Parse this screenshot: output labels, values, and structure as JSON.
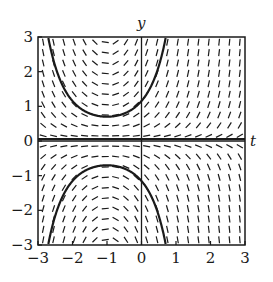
{
  "figure": {
    "type": "slope-field",
    "equation_hint": "dy/dt = (t + 1) y",
    "axes": {
      "x_name": "t",
      "y_name": "y",
      "xlim": [
        -3,
        3
      ],
      "ylim": [
        -3,
        3
      ],
      "x_ticks": [
        "-3",
        "-2",
        "-1",
        "0",
        "1",
        "2",
        "3"
      ],
      "y_ticks": [
        "3",
        "2",
        "1",
        "0",
        "-1",
        "-2",
        "-3"
      ]
    },
    "grid_spacing": 0.3,
    "solution_curves": [
      {
        "name": "upper",
        "y0_at_t_minus1": 0.7
      },
      {
        "name": "lower",
        "y0_at_t_minus1": -0.7
      },
      {
        "name": "equilibrium",
        "y": 0
      }
    ],
    "colors": {
      "ink": "#1a1a1a",
      "background": "#ffffff"
    }
  }
}
